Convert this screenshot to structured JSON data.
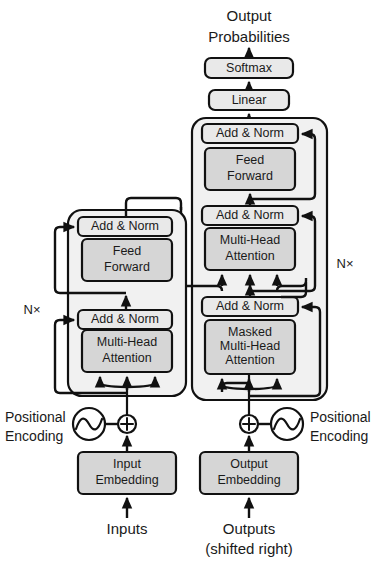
{
  "figure": {
    "colors": {
      "block_fill": "#d6d6d6",
      "block_fill_light": "#e9e9e9",
      "panel_fill": "#f1f1f1",
      "stroke": "#111111",
      "background": "#ffffff"
    }
  },
  "top": {
    "output_probabilities_line1": "Output",
    "output_probabilities_line2": "Probabilities",
    "softmax": "Softmax",
    "linear": "Linear"
  },
  "encoder": {
    "repeat_label": "N×",
    "blocks": [
      {
        "name": "add-norm-upper",
        "label": "Add & Norm"
      },
      {
        "name": "feed-forward",
        "label_line1": "Feed",
        "label_line2": "Forward"
      },
      {
        "name": "add-norm-lower",
        "label": "Add & Norm"
      },
      {
        "name": "multi-head-attention",
        "label_line1": "Multi-Head",
        "label_line2": "Attention"
      }
    ]
  },
  "decoder": {
    "repeat_label": "N×",
    "blocks": [
      {
        "name": "add-norm-top",
        "label": "Add & Norm"
      },
      {
        "name": "feed-forward",
        "label_line1": "Feed",
        "label_line2": "Forward"
      },
      {
        "name": "add-norm-middle",
        "label": "Add & Norm"
      },
      {
        "name": "cross-attention",
        "label_line1": "Multi-Head",
        "label_line2": "Attention"
      },
      {
        "name": "add-norm-bottom",
        "label": "Add & Norm"
      },
      {
        "name": "masked-attention",
        "label_line1": "Masked",
        "label_line2": "Multi-Head",
        "label_line3": "Attention"
      }
    ]
  },
  "bottom_left": {
    "positional_encoding_line1": "Positional",
    "positional_encoding_line2": "Encoding",
    "embedding_line1": "Input",
    "embedding_line2": "Embedding",
    "source_label": "Inputs"
  },
  "bottom_right": {
    "positional_encoding_line1": "Positional",
    "positional_encoding_line2": "Encoding",
    "embedding_line1": "Output",
    "embedding_line2": "Embedding",
    "source_label_line1": "Outputs",
    "source_label_line2": "(shifted right)"
  }
}
